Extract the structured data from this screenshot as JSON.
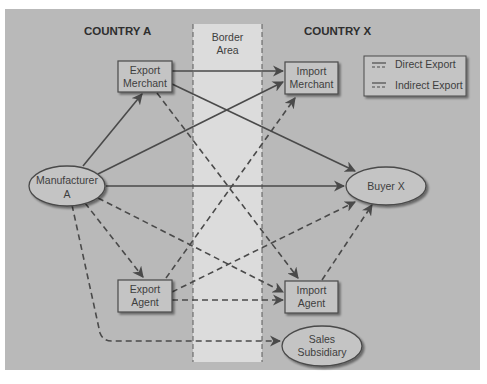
{
  "diagram": {
    "title_left": "COUNTRY A",
    "title_right": "COUNTRY X",
    "border_area": {
      "line1": "Border",
      "line2": "Area"
    },
    "nodes": {
      "manufacturer": {
        "line1": "Manufacturer",
        "line2": "A",
        "shape": "ellipse"
      },
      "export_merchant": {
        "line1": "Export",
        "line2": "Merchant",
        "shape": "box"
      },
      "export_agent": {
        "line1": "Export",
        "line2": "Agent",
        "shape": "box"
      },
      "import_merchant": {
        "line1": "Import",
        "line2": "Merchant",
        "shape": "box"
      },
      "import_agent": {
        "line1": "Import",
        "line2": "Agent",
        "shape": "box"
      },
      "buyer": {
        "line1": "Buyer X",
        "shape": "ellipse"
      },
      "sales_subsidiary": {
        "line1": "Sales",
        "line2": "Subsidiary",
        "shape": "ellipse"
      }
    },
    "legend": {
      "direct": "Direct Export",
      "indirect": "Indirect Export"
    },
    "edges": [
      {
        "from": "Manufacturer A",
        "to": "Export Merchant",
        "type": "direct"
      },
      {
        "from": "Manufacturer A",
        "to": "Import Merchant",
        "type": "direct"
      },
      {
        "from": "Manufacturer A",
        "to": "Buyer X",
        "type": "direct"
      },
      {
        "from": "Export Merchant",
        "to": "Import Merchant",
        "type": "direct"
      },
      {
        "from": "Export Merchant",
        "to": "Buyer X",
        "type": "direct"
      },
      {
        "from": "Export Merchant",
        "to": "Import Agent",
        "type": "indirect"
      },
      {
        "from": "Manufacturer A",
        "to": "Export Agent",
        "type": "indirect"
      },
      {
        "from": "Manufacturer A",
        "to": "Import Agent",
        "type": "indirect"
      },
      {
        "from": "Manufacturer A",
        "to": "Buyer X",
        "type": "indirect"
      },
      {
        "from": "Manufacturer A",
        "to": "Sales Subsidiary",
        "type": "indirect"
      },
      {
        "from": "Export Agent",
        "to": "Import Merchant",
        "type": "indirect"
      },
      {
        "from": "Export Agent",
        "to": "Buyer X",
        "type": "indirect"
      },
      {
        "from": "Export Agent",
        "to": "Import Agent",
        "type": "indirect"
      },
      {
        "from": "Import Agent",
        "to": "Buyer X",
        "type": "indirect"
      }
    ],
    "colors": {
      "panel": "#b9b9b9",
      "border_area": "#dcdcdc",
      "node_fill": "#c4c4c4",
      "stroke": "#4a4a4a"
    }
  }
}
